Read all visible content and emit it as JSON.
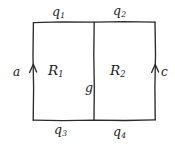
{
  "figure": {
    "type": "hand-drawn-diagram",
    "background_color": "#ffffff",
    "ink_color": "#2b2b2b",
    "outer_rectangle": {
      "left": 33,
      "top": 22,
      "right": 155,
      "bottom": 120
    },
    "divider_x": 94,
    "edge_flux_labels": {
      "top_left": {
        "base": "q",
        "sub": "1"
      },
      "top_right": {
        "base": "q",
        "sub": "2"
      },
      "bottom_left": {
        "base": "q",
        "sub": "3"
      },
      "bottom_right": {
        "base": "q",
        "sub": "4"
      }
    },
    "region_labels": {
      "left": {
        "base": "R",
        "sub": "1"
      },
      "right": {
        "base": "R",
        "sub": "2"
      }
    },
    "side_labels": {
      "left_arrow": "a",
      "right_arrow": "c"
    },
    "divider_label": "g",
    "arrows": [
      {
        "name": "left-edge-arrow",
        "direction": "up",
        "x": 33
      },
      {
        "name": "right-edge-arrow",
        "direction": "up",
        "x": 155
      }
    ]
  }
}
